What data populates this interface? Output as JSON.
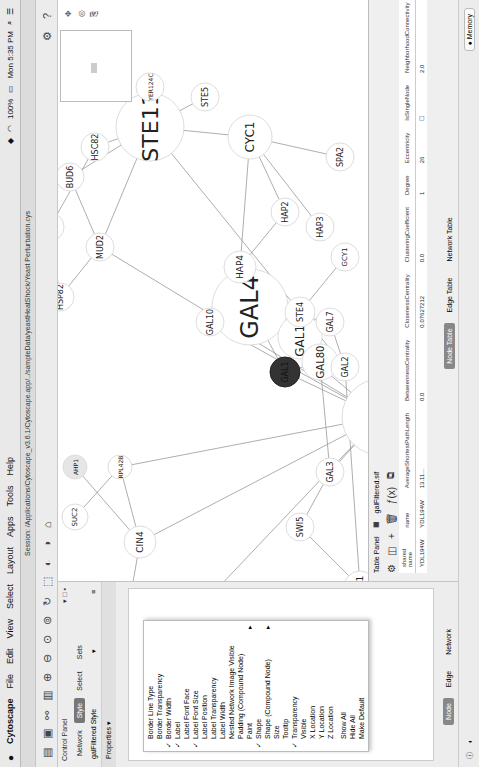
{
  "menubar": {
    "app": "Cytoscape",
    "items": [
      "File",
      "Edit",
      "View",
      "Select",
      "Layout",
      "Apps",
      "Tools",
      "Help"
    ],
    "battery": "100%",
    "clock": "Mon 5:35 PM"
  },
  "window": {
    "title": "Session: /Applications/Cytoscape_v3.6.1/Cytoscape.app/../sampleData/yeastHeatShock/Yeast Perturbation.cys"
  },
  "control_panel": {
    "title": "Control Panel",
    "tabs": [
      {
        "label": "Network",
        "active": false
      },
      {
        "label": "Style",
        "active": true
      },
      {
        "label": "Select",
        "active": false
      },
      {
        "label": "Sets",
        "active": false
      }
    ],
    "style_name": "galFiltered Style",
    "properties_label": "Properties ▾",
    "bottom_tabs": [
      {
        "label": "Node",
        "active": true
      },
      {
        "label": "Edge",
        "active": false
      },
      {
        "label": "Network",
        "active": false
      }
    ]
  },
  "properties_menu": {
    "items": [
      {
        "label": "Border Line Type",
        "checked": false
      },
      {
        "label": "Border Transparency",
        "checked": false
      },
      {
        "label": "Border Width",
        "checked": true
      },
      {
        "label": "Label",
        "checked": true
      },
      {
        "label": "Label Font Face",
        "checked": false
      },
      {
        "label": "Label Font Size",
        "checked": true
      },
      {
        "label": "Label Position",
        "checked": false
      },
      {
        "label": "Label Transparency",
        "checked": false
      },
      {
        "label": "Label Width",
        "checked": false
      },
      {
        "label": "Nested Network Image Visible",
        "checked": false
      },
      {
        "label": "Padding (Compound Node)",
        "checked": false
      },
      {
        "label": "Paint",
        "checked": false,
        "submenu": true
      },
      {
        "label": "Shape",
        "checked": true
      },
      {
        "label": "Shape (Compound Node)",
        "checked": false,
        "submenu": true
      },
      {
        "label": "Size",
        "checked": false
      },
      {
        "label": "Tooltip",
        "checked": false
      },
      {
        "label": "Transparency",
        "checked": true
      },
      {
        "label": "Visible",
        "checked": false
      },
      {
        "label": "X Location",
        "checked": false
      },
      {
        "label": "Y Location",
        "checked": false
      },
      {
        "label": "Z Location",
        "checked": false
      }
    ],
    "actions": [
      "Show All",
      "Hide All",
      "Make Default"
    ]
  },
  "network": {
    "selected_node": "GAL1",
    "nodes": [
      {
        "id": "STE11",
        "x": 330,
        "y": 115,
        "r": 34,
        "fs": 22
      },
      {
        "id": "MIG1",
        "x": 160,
        "y": 260,
        "r": 38,
        "fs": 24
      },
      {
        "id": "GAL4",
        "x": 280,
        "y": 220,
        "r": 38,
        "fs": 24
      },
      {
        "id": "GAL11",
        "x": 300,
        "y": 260,
        "r": 22,
        "fs": 12
      },
      {
        "id": "GAL80",
        "x": 310,
        "y": 285,
        "r": 18,
        "fs": 10
      },
      {
        "id": "GAL1",
        "x": 325,
        "y": 230,
        "r": 15,
        "fs": 8
      },
      {
        "id": "GAL10",
        "x": 350,
        "y": 200,
        "r": 14,
        "fs": 8
      },
      {
        "id": "CYC1",
        "x": 380,
        "y": 60,
        "r": 22,
        "fs": 12
      },
      {
        "id": "GPA1",
        "x": 520,
        "y": 100,
        "r": 14,
        "fs": 8
      },
      {
        "id": "YER124C",
        "x": 490,
        "y": 130,
        "r": 14,
        "fs": 6
      },
      {
        "id": "STE5",
        "x": 440,
        "y": 150,
        "r": 14,
        "fs": 8
      },
      {
        "id": "HSC82",
        "x": 350,
        "y": 205,
        "r": 14,
        "fs": 8
      },
      {
        "id": "BUD6",
        "x": 380,
        "y": 228,
        "r": 14,
        "fs": 8
      },
      {
        "id": "CNS1",
        "x": 290,
        "y": 250,
        "r": 14,
        "fs": 8
      },
      {
        "id": "MUD2",
        "x": 330,
        "y": 280,
        "r": 14,
        "fs": 8
      },
      {
        "id": "HSP82",
        "x": 250,
        "y": 275,
        "r": 14,
        "fs": 8
      },
      {
        "id": "HAP4",
        "x": 290,
        "y": 180,
        "r": 16,
        "fs": 9
      },
      {
        "id": "HAP2",
        "x": 300,
        "y": 115,
        "r": 14,
        "fs": 8
      },
      {
        "id": "HAP3",
        "x": 275,
        "y": 95,
        "r": 14,
        "fs": 8
      },
      {
        "id": "SPA2",
        "x": 250,
        "y": 40,
        "r": 14,
        "fs": 8
      },
      {
        "id": "STE4",
        "x": 255,
        "y": 155,
        "r": 15,
        "fs": 8
      },
      {
        "id": "GCY1",
        "x": 270,
        "y": 130,
        "r": 14,
        "fs": 7
      },
      {
        "id": "GAL7",
        "x": 230,
        "y": 145,
        "r": 14,
        "fs": 8
      },
      {
        "id": "GAL2",
        "x": 200,
        "y": 145,
        "r": 14,
        "fs": 8
      },
      {
        "id": "GAL3",
        "x": 135,
        "y": 240,
        "r": 14,
        "fs": 8
      },
      {
        "id": "SWI5",
        "x": 115,
        "y": 205,
        "r": 14,
        "fs": 8
      },
      {
        "id": "FAR1",
        "x": 150,
        "y": 120,
        "r": 16,
        "fs": 9
      },
      {
        "id": "CIN4",
        "x": 70,
        "y": 260,
        "r": 16,
        "fs": 9
      },
      {
        "id": "RPL42B",
        "x": 130,
        "y": 300,
        "r": 12,
        "fs": 6
      },
      {
        "id": "SUC2",
        "x": 100,
        "y": 320,
        "r": 13,
        "fs": 7
      },
      {
        "id": "AHP1",
        "x": 125,
        "y": 325,
        "r": 12,
        "fs": 6
      },
      {
        "id": "FBP1",
        "x": 45,
        "y": 200,
        "r": 14,
        "fs": 7
      },
      {
        "id": "PDC1",
        "x": 20,
        "y": 295,
        "r": 16,
        "fs": 9
      }
    ]
  },
  "table_panel": {
    "title": "Table Panel",
    "network_name": "galFiltered.sif",
    "columns": [
      "shared name",
      "name",
      "AverageShortestPathLength",
      "BetweennessCentrality",
      "ClosenessCentrality",
      "ClusteringCoefficient",
      "Degree",
      "Eccentricity",
      "IsSingleNode",
      "NeighborhoodConnectivity"
    ],
    "rows": [
      [
        "YDL194W",
        "YDL194W",
        "13.11...",
        "0.0",
        "0.07627212",
        "0.0",
        "1",
        "26",
        "☐",
        "2.0"
      ]
    ],
    "tabs": [
      {
        "label": "Node Table",
        "active": true
      },
      {
        "label": "Edge Table",
        "active": false
      },
      {
        "label": "Network Table",
        "active": false
      }
    ]
  },
  "statusbar": {
    "memory_label": "Memory"
  }
}
